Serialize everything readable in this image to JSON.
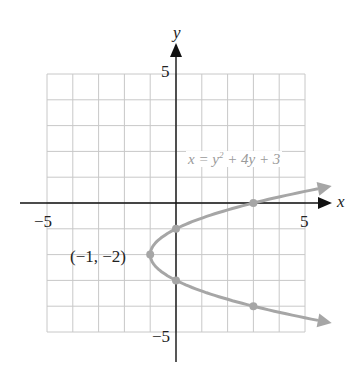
{
  "chart_data": {
    "type": "line",
    "title": "",
    "equation": "x = y² + 4y + 3",
    "equation_parts": {
      "lhs": "x = y",
      "exp": "2",
      "rhs": " + 4y + 3"
    },
    "xlabel": "x",
    "ylabel": "y",
    "xlim": [
      -5,
      5
    ],
    "ylim": [
      -5,
      5
    ],
    "grid": true,
    "x_tick_labels": {
      "neg": "−5",
      "pos": "5"
    },
    "y_tick_labels": {
      "pos": "5",
      "neg": "−5"
    },
    "vertex": {
      "x": -1,
      "y": -2,
      "label": "(−1, −2)"
    },
    "highlighted_points": [
      {
        "x": 3,
        "y": 0
      },
      {
        "x": 0,
        "y": -1
      },
      {
        "x": -1,
        "y": -2
      },
      {
        "x": 0,
        "y": -3
      },
      {
        "x": 3,
        "y": -4
      }
    ],
    "curve": {
      "name": "x = y^2 + 4y + 3",
      "y_range": [
        -4.55,
        0.55
      ],
      "arrows_at_ends": true
    },
    "colors": {
      "curve": "#a6a6a6",
      "grid": "#c8c8c8",
      "axis": "#111111",
      "equation_text": "#9a9a9a"
    }
  }
}
